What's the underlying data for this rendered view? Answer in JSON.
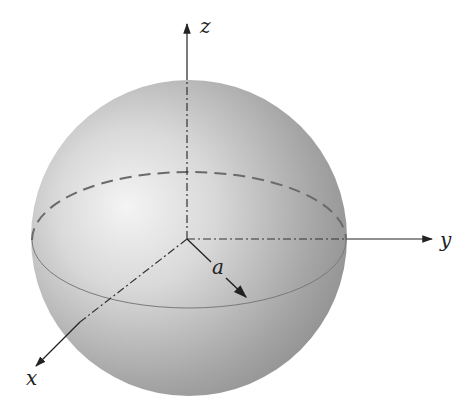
{
  "figure": {
    "axes": {
      "x_label": "x",
      "y_label": "y",
      "z_label": "z"
    },
    "radius_label": "a",
    "colors": {
      "sphere_light": "#f2f2f2",
      "sphere_dark": "#8e8e8e",
      "axis": "#222222",
      "equator_dashed": "#666666"
    }
  }
}
